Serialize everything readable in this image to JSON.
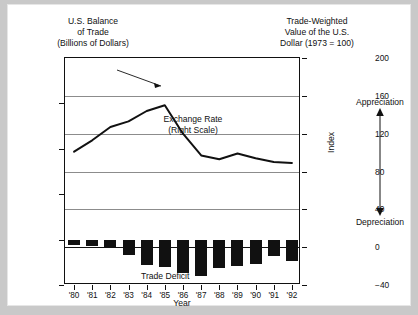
{
  "figure": {
    "title_left": "U.S. Balance\nof Trade\n(Billions of Dollars)",
    "title_right": "Trade-Weighted\nValue of the U.S.\nDollar (1973 = 100)",
    "index_axis_label": "Index",
    "appreciation_label": "Appreciation",
    "depreciation_label": "Depreciation",
    "annotation_exchange_rate": "Exchange Rate\n(Right Scale)",
    "annotation_trade_deficit": "Trade Deficit",
    "colors": {
      "bar": "#111111",
      "line": "#111111",
      "grid": "#8c8c8c",
      "frame": "#111111",
      "background": "#ffffff",
      "page": "#c9c9c9"
    }
  },
  "chart_data": {
    "type": "bar",
    "xlabel": "Year",
    "ylabel": "Billions of Dollars",
    "ylabel_right": "Index",
    "grid": true,
    "legend": "inline-annotations",
    "categories": [
      "'80",
      "'81",
      "'82",
      "'83",
      "'84",
      "'85",
      "'86",
      "'87",
      "'88",
      "'89",
      "'90",
      "'91",
      "'92"
    ],
    "x": [
      1980,
      1981,
      1982,
      1983,
      1984,
      1985,
      1986,
      1987,
      1988,
      1989,
      1990,
      1991,
      1992
    ],
    "ylim": [
      -200,
      800
    ],
    "yticks": [
      -200,
      0,
      200,
      400,
      600
    ],
    "ytick_labels": [
      "−200",
      "0",
      "+200",
      "+400",
      "+600"
    ],
    "ylim_right": [
      -40,
      200
    ],
    "yticks_right": [
      -40,
      0,
      40,
      80,
      120,
      160,
      200
    ],
    "ytick_labels_right": [
      "−40",
      "0",
      "40",
      "80",
      "120",
      "160",
      "200"
    ],
    "series": [
      {
        "name": "Trade Deficit",
        "type": "bar",
        "axis": "left",
        "unit": "Billions of Dollars",
        "values": [
          -25,
          -28,
          -36,
          -67,
          -112,
          -122,
          -145,
          -160,
          -127,
          -115,
          -109,
          -74,
          -96
        ]
      },
      {
        "name": "Exchange Rate",
        "type": "line",
        "axis": "right",
        "unit": "Index (1973 = 100)",
        "values": [
          101,
          113,
          127,
          133,
          144,
          150,
          120,
          97,
          93,
          99,
          94,
          90,
          89
        ]
      }
    ]
  }
}
